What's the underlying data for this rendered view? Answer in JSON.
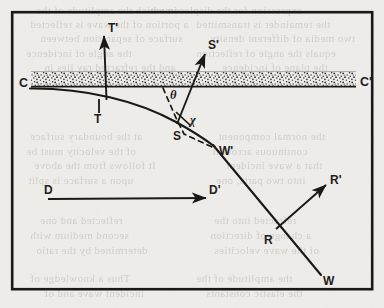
{
  "figure": {
    "kind": "scanned-line-diagram",
    "background_color": "#efedea",
    "ink_color": "#171614",
    "frame": {
      "x": 11,
      "y": 11,
      "width": 362,
      "height": 280,
      "stroke_width": 2.4
    },
    "band": {
      "name": "stippled-layer",
      "left_label": "C",
      "right_label": "C'",
      "x1": 30,
      "x2": 356,
      "top": 72,
      "bottom": 86,
      "baseline_y": 87,
      "fill_pattern": "stipple-dots"
    },
    "curve": {
      "name": "wavefront-curve",
      "description": "curve entering at left, crossing band, bending down to the right",
      "path": "M 30,88 C 86,88 138,100 176,121 C 196,132 206,139 214,146"
    },
    "ray": {
      "name": "ray-line",
      "description": "straight descending segment from W' through R to W",
      "x1": 214,
      "y1": 146,
      "x2": 320,
      "y2": 274
    },
    "arrows": [
      {
        "name": "t-prime-arrow",
        "label": "T'",
        "x1": 107,
        "y1": 92,
        "x2": 104,
        "y2": 34,
        "label_x": 110,
        "label_y": 30
      },
      {
        "name": "s-prime-arrow",
        "label": "S'",
        "x1": 178,
        "y1": 122,
        "x2": 205,
        "y2": 52,
        "label_x": 210,
        "label_y": 47
      },
      {
        "name": "r-prime-arrow",
        "label": "R'",
        "x1": 277,
        "y1": 228,
        "x2": 327,
        "y2": 184,
        "label_x": 331,
        "label_y": 182
      },
      {
        "name": "d-arrow",
        "label": "D'",
        "x1": 48,
        "y1": 198,
        "x2": 206,
        "y2": 198,
        "label_x": 210,
        "label_y": 194
      }
    ],
    "points": [
      {
        "name": "point-t",
        "label": "T",
        "x": 100,
        "y": 107,
        "tick": true
      },
      {
        "name": "point-s",
        "label": "S",
        "x": 178,
        "y": 134
      },
      {
        "name": "point-w-prime",
        "label": "W'",
        "x": 222,
        "y": 150
      },
      {
        "name": "point-r",
        "label": "R",
        "x": 268,
        "y": 237
      },
      {
        "name": "point-w",
        "label": "W",
        "x": 325,
        "y": 281
      },
      {
        "name": "point-d",
        "label": "D",
        "x": 45,
        "y": 190
      },
      {
        "name": "point-c",
        "label": "C",
        "x": 21,
        "y": 83
      },
      {
        "name": "point-c-prime",
        "label": "C'",
        "x": 362,
        "y": 83
      }
    ],
    "angles": [
      {
        "name": "angle-theta",
        "label": "θ",
        "x": 174,
        "y": 94
      },
      {
        "name": "angle-chi",
        "label": "χ",
        "x": 193,
        "y": 118
      }
    ],
    "dashed": {
      "name": "dashed-normal-line",
      "description": "dashed line through S continuing toward W'",
      "path": "M 163,88 L 176,119 L 183,133 L 213,147"
    },
    "tick_marks": [
      {
        "name": "tick-t",
        "x1": 96,
        "y1": 100,
        "x2": 96,
        "y2": 112
      },
      {
        "name": "tick-chi",
        "x1": 176,
        "y1": 113,
        "x2": 190,
        "y2": 125
      }
    ]
  },
  "ghost_text": {
    "note": "faint mirrored show-through text from the reverse side of the page",
    "lines": [
      {
        "text": "in which the amplitude of the",
        "x": 36,
        "y": 4
      },
      {
        "text": "expression for the displacement",
        "x": 150,
        "y": 4
      },
      {
        "text": "a portion of the wave is reflected",
        "x": 30,
        "y": 18
      },
      {
        "text": "the remainder is transmitted",
        "x": 196,
        "y": 18
      },
      {
        "text": "surface of separation between",
        "x": 40,
        "y": 32
      },
      {
        "text": "two media of different density",
        "x": 210,
        "y": 32
      },
      {
        "text": "the angle of incidence",
        "x": 26,
        "y": 47
      },
      {
        "text": "equals the angle of reflection",
        "x": 196,
        "y": 47
      },
      {
        "text": "and the refracted ray lies in",
        "x": 44,
        "y": 61
      },
      {
        "text": "the plane of incidence",
        "x": 222,
        "y": 61
      },
      {
        "text": "at the boundary surface",
        "x": 30,
        "y": 130
      },
      {
        "text": "the normal component",
        "x": 218,
        "y": 130
      },
      {
        "text": "of the velocity must be",
        "x": 26,
        "y": 145
      },
      {
        "text": "continuous across it",
        "x": 212,
        "y": 145
      },
      {
        "text": "It follows from the above",
        "x": 34,
        "y": 159
      },
      {
        "text": "that a wave incident",
        "x": 226,
        "y": 159
      },
      {
        "text": "upon a surface is split",
        "x": 28,
        "y": 174
      },
      {
        "text": "into two parts, one",
        "x": 216,
        "y": 174
      },
      {
        "text": "reflected and one",
        "x": 40,
        "y": 214
      },
      {
        "text": "refracted into the",
        "x": 214,
        "y": 214
      },
      {
        "text": "second medium with",
        "x": 30,
        "y": 229
      },
      {
        "text": "a change of direction",
        "x": 210,
        "y": 229
      },
      {
        "text": "determined by the ratio",
        "x": 36,
        "y": 244
      },
      {
        "text": "of the wave velocities",
        "x": 214,
        "y": 244
      },
      {
        "text": "Thus a knowledge of",
        "x": 30,
        "y": 272
      },
      {
        "text": "the amplitude of the",
        "x": 196,
        "y": 272
      },
      {
        "text": "incident wave and of",
        "x": 44,
        "y": 287
      },
      {
        "text": "the elastic constants",
        "x": 206,
        "y": 287
      }
    ]
  }
}
